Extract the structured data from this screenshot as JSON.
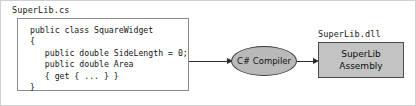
{
  "diagram": {
    "source": {
      "file_label": "SuperLib.cs",
      "code": "public class SquareWidget\n{\n   public double SideLength = 0;\n   public double Area\n   { get { ... } }\n}"
    },
    "compiler": {
      "label": "C# Compiler",
      "shape": "ellipse",
      "fill_color": "#b9b9b9",
      "stroke_color": "#3a3a3a"
    },
    "output": {
      "file_label": "SuperLib.dll",
      "box_line1": "SuperLib",
      "box_line2": "Assembly",
      "fill_color": "#c3c3c3",
      "stroke_color": "#4a4a4a"
    },
    "arrows": [
      {
        "name": "source-to-compiler",
        "from": "code-box",
        "to": "compiler"
      },
      {
        "name": "compiler-to-assembly",
        "from": "compiler",
        "to": "assembly-box"
      }
    ],
    "colors": {
      "background": "#ffffff",
      "text": "#151515",
      "arrow": "#2b2b2b",
      "code_border": "#8c8c8c"
    }
  }
}
